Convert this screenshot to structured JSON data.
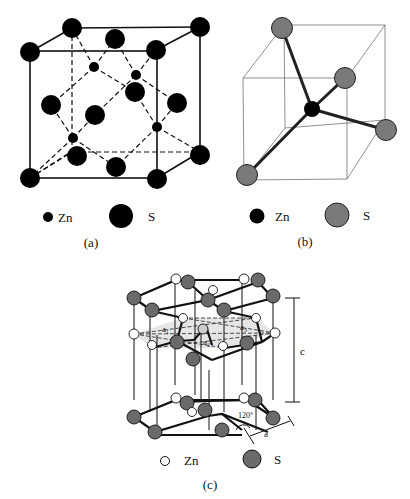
{
  "figure": {
    "panels": [
      {
        "id": "a",
        "caption": "(a)",
        "description": "Zinc blende (sphalerite) cubic unit cell",
        "legend": [
          {
            "symbol": "small-black-circle",
            "label": "Zn",
            "color": "#000000"
          },
          {
            "symbol": "large-black-circle",
            "label": "S",
            "color": "#000000"
          }
        ]
      },
      {
        "id": "b",
        "caption": "(b)",
        "description": "Tetrahedral coordination of Zn by four S atoms in cube",
        "legend": [
          {
            "symbol": "black-circle",
            "label": "Zn",
            "color": "#000000"
          },
          {
            "symbol": "gray-circle",
            "label": "S",
            "color": "#777777"
          }
        ]
      },
      {
        "id": "c",
        "caption": "(c)",
        "description": "Wurtzite hexagonal structure",
        "annotations": {
          "a1": "a₁",
          "a2": "a₂",
          "a3": "a₃",
          "c": "c",
          "a": "a",
          "angle": "120°"
        },
        "legend": [
          {
            "symbol": "white-circle",
            "label": "Zn",
            "color": "#ffffff"
          },
          {
            "symbol": "gray-circle",
            "label": "S",
            "color": "#6e6e6e"
          }
        ]
      }
    ]
  },
  "colors": {
    "atom_black": "#000000",
    "atom_gray_b": "#7a7a7a",
    "atom_gray_c": "#6a6a6a",
    "line": "#111111"
  }
}
